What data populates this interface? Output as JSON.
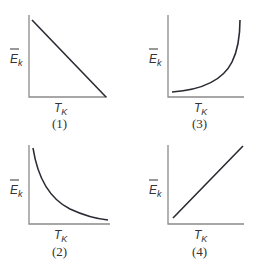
{
  "panels": [
    {
      "id": "1",
      "caption": "(1)",
      "ylabel_main": "E",
      "ylabel_sub": "k",
      "xlabel_main": "T",
      "xlabel_sub": "K",
      "shape": "linear-decreasing"
    },
    {
      "id": "3",
      "caption": "(3)",
      "ylabel_main": "E",
      "ylabel_sub": "k",
      "xlabel_main": "T",
      "xlabel_sub": "K",
      "shape": "exponential-increasing"
    },
    {
      "id": "2",
      "caption": "(2)",
      "ylabel_main": "E",
      "ylabel_sub": "k",
      "xlabel_main": "T",
      "xlabel_sub": "K",
      "shape": "hyperbolic-decreasing"
    },
    {
      "id": "4",
      "caption": "(4)",
      "ylabel_main": "E",
      "ylabel_sub": "k",
      "xlabel_main": "T",
      "xlabel_sub": "K",
      "shape": "linear-increasing"
    }
  ],
  "colors": {
    "axis": "#8a8a8a",
    "curve": "#2a2a33",
    "text": "#333333"
  }
}
